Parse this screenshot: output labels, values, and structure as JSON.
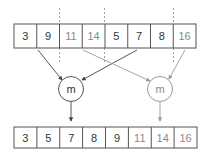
{
  "diagram": {
    "title": "",
    "top_row": {
      "cells": [
        {
          "value": "3",
          "tone": "dark"
        },
        {
          "value": "9",
          "tone": "dark"
        },
        {
          "value": "11",
          "tone": "light"
        },
        {
          "value": "14",
          "tone": "light"
        },
        {
          "value": "5",
          "tone": "dark"
        },
        {
          "value": "7",
          "tone": "dark"
        },
        {
          "value": "8",
          "tone": "dark"
        },
        {
          "value": "16",
          "tone": "light"
        }
      ]
    },
    "merge_nodes": [
      {
        "label": "m",
        "tone": "dark"
      },
      {
        "label": "m",
        "tone": "light"
      }
    ],
    "bottom_row": {
      "cells": [
        {
          "value": "3",
          "tone": "dark"
        },
        {
          "value": "5",
          "tone": "dark"
        },
        {
          "value": "7",
          "tone": "dark"
        },
        {
          "value": "8",
          "tone": "dark"
        },
        {
          "value": "9",
          "tone": "dark"
        },
        {
          "value": "11",
          "tone": "light"
        },
        {
          "value": "14",
          "tone": "light"
        },
        {
          "value": "16",
          "tone": "light"
        }
      ]
    },
    "colors": {
      "stroke": "#555555",
      "light_stroke": "#999999",
      "dashed": "#888888"
    }
  }
}
